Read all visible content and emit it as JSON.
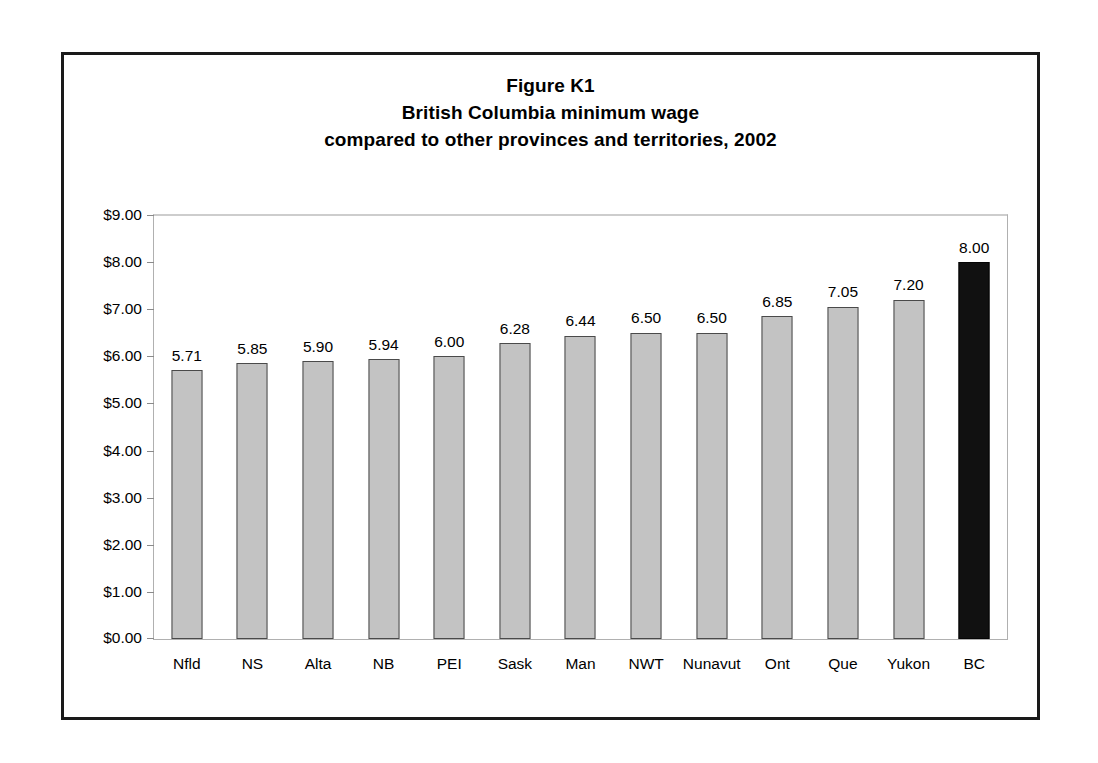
{
  "figure": {
    "title_lines": [
      "Figure K1",
      "British Columbia minimum wage",
      "compared to other provinces and territories, 2002"
    ],
    "border_color": "#1a1a1a"
  },
  "chart_data": {
    "type": "bar",
    "title": "Figure K1 British Columbia minimum wage compared to other provinces and territories, 2002",
    "subtitle": "",
    "xlabel": "",
    "ylabel": "",
    "categories": [
      "Nfld",
      "NS",
      "Alta",
      "NB",
      "PEI",
      "Sask",
      "Man",
      "NWT",
      "Nunavut",
      "Ont",
      "Que",
      "Yukon",
      "BC"
    ],
    "values": [
      5.71,
      5.85,
      5.9,
      5.94,
      6.0,
      6.28,
      6.44,
      6.5,
      6.5,
      6.85,
      7.05,
      7.2,
      8.0
    ],
    "value_labels": [
      "5.71",
      "5.85",
      "5.90",
      "5.94",
      "6.00",
      "6.28",
      "6.44",
      "6.50",
      "6.50",
      "6.85",
      "7.05",
      "7.20",
      "8.00"
    ],
    "highlight_category": "BC",
    "ylim": [
      0,
      9
    ],
    "ytick_step": 1,
    "ytick_labels": [
      "$9.00",
      "$8.00",
      "$7.00",
      "$6.00",
      "$5.00",
      "$4.00",
      "$3.00",
      "$2.00",
      "$1.00",
      "$0.00"
    ],
    "ytick_values": [
      9,
      8,
      7,
      6,
      5,
      4,
      3,
      2,
      1,
      0
    ],
    "grid": "top-line-only",
    "legend": "none",
    "bar_color": "#c3c3c3",
    "bar_border_color": "#4a4a4a",
    "highlight_color": "#111111"
  }
}
